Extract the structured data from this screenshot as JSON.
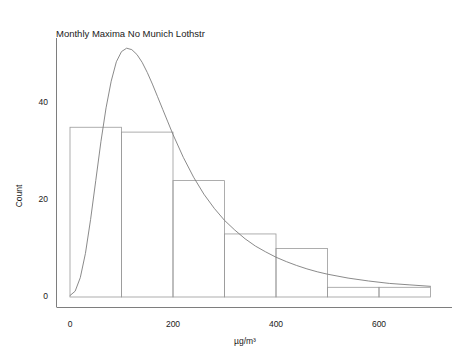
{
  "chart_data": {
    "type": "bar",
    "title": "Monthly Maxima No Munich Lothstr",
    "xlabel": "µg/m³",
    "ylabel": "Count",
    "xlim": [
      -20,
      720
    ],
    "ylim": [
      0,
      55
    ],
    "grid": false,
    "legend": null,
    "xticks": [
      0,
      200,
      400,
      600
    ],
    "xtick_labels": [
      "0",
      "200",
      "400",
      "600"
    ],
    "yticks": [
      0,
      20,
      40
    ],
    "ytick_labels": [
      "0",
      "20",
      "40"
    ],
    "bin_width": 100,
    "bin_edges": [
      0,
      100,
      200,
      300,
      400,
      500,
      600,
      700
    ],
    "categories": [
      "0-100",
      "100-200",
      "200-300",
      "300-400",
      "400-500",
      "500-600",
      "600-700"
    ],
    "values": [
      35,
      34,
      24,
      13,
      10,
      2,
      2
    ],
    "series": [
      {
        "name": "Count",
        "type": "histogram",
        "values": [
          35,
          34,
          24,
          13,
          10,
          2,
          2
        ]
      },
      {
        "name": "Fitted density",
        "type": "line",
        "peak_x": 122,
        "peak_y": 51,
        "x": [
          0,
          10,
          20,
          30,
          40,
          50,
          60,
          70,
          80,
          90,
          100,
          110,
          120,
          130,
          140,
          150,
          160,
          170,
          180,
          190,
          200,
          220,
          240,
          260,
          280,
          300,
          320,
          340,
          360,
          380,
          400,
          420,
          440,
          460,
          480,
          500,
          540,
          580,
          620,
          660,
          700
        ],
        "y": [
          0.3,
          1.2,
          4.0,
          9.0,
          16.0,
          24.0,
          32.0,
          39.0,
          44.5,
          48.5,
          50.6,
          51.3,
          51.0,
          50.0,
          48.4,
          46.3,
          43.9,
          41.3,
          38.7,
          36.1,
          33.5,
          28.8,
          24.7,
          21.2,
          18.3,
          15.8,
          13.8,
          12.0,
          10.5,
          9.3,
          8.2,
          7.3,
          6.5,
          5.8,
          5.2,
          4.7,
          3.9,
          3.3,
          2.8,
          2.5,
          2.2
        ]
      }
    ],
    "colors": {
      "bar_edge": "#9a9a9a",
      "curve": "#7d7d7d",
      "axis": "#6f6f6f",
      "text": "#1a1a1a",
      "background": "#ffffff"
    }
  }
}
